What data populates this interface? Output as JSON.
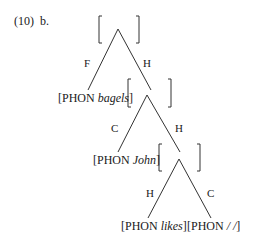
{
  "example": {
    "number": "(10)",
    "sub": "b."
  },
  "tree": {
    "root": {
      "type": "empty-avm"
    },
    "edges": {
      "root_left": "F",
      "root_right": "H",
      "n1_left": "C",
      "n1_right": "H",
      "n2_left": "H",
      "n2_right": "C"
    },
    "leaves": [
      {
        "feature": "PHON",
        "value": "bagels"
      },
      {
        "feature": "PHON",
        "value": "John"
      },
      {
        "feature": "PHON",
        "value": "likes"
      },
      {
        "feature": "PHON",
        "value": "/ /"
      }
    ]
  }
}
